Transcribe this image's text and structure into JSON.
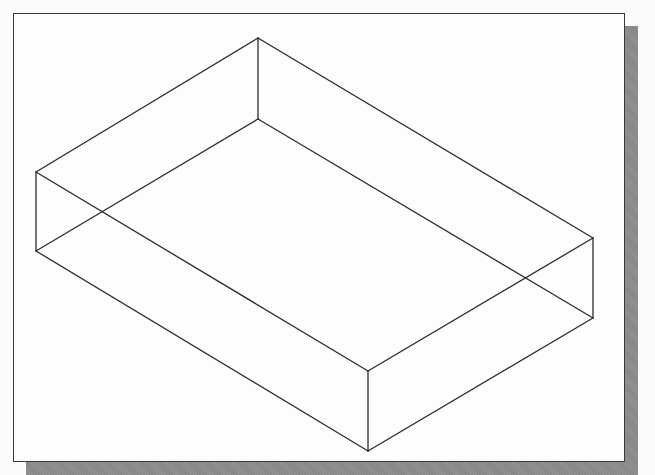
{
  "figure": {
    "colors": {
      "line": "#2b2b2b",
      "frame_border": "#3a3a3a",
      "frame_fill": "#fdfdfd",
      "shadow": "#8c8c8c",
      "background": "#fbfbfb"
    },
    "vertices": {
      "top_back": [
        258,
        38
      ],
      "top_left": [
        36,
        172
      ],
      "top_right": [
        593,
        238
      ],
      "top_front": [
        368,
        371
      ],
      "bottom_back": [
        258,
        119
      ],
      "bottom_left": [
        36,
        251
      ],
      "bottom_right": [
        593,
        318
      ],
      "bottom_front": [
        368,
        451
      ]
    },
    "edges": [
      [
        "top_back",
        "top_left"
      ],
      [
        "top_back",
        "top_right"
      ],
      [
        "top_left",
        "top_front"
      ],
      [
        "top_right",
        "top_front"
      ],
      [
        "bottom_back",
        "bottom_left"
      ],
      [
        "bottom_back",
        "bottom_right"
      ],
      [
        "bottom_left",
        "bottom_front"
      ],
      [
        "bottom_right",
        "bottom_front"
      ],
      [
        "top_back",
        "bottom_back"
      ],
      [
        "top_left",
        "bottom_left"
      ],
      [
        "top_right",
        "bottom_right"
      ],
      [
        "top_front",
        "bottom_front"
      ]
    ]
  }
}
